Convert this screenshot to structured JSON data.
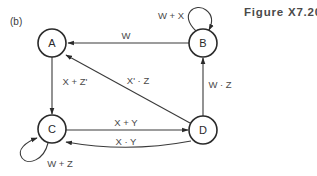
{
  "figure": {
    "title": "Figure X7.20",
    "panel_label": "(b)"
  },
  "diagram": {
    "type": "state-diagram",
    "nodes": [
      {
        "id": "A",
        "label": "A"
      },
      {
        "id": "B",
        "label": "B"
      },
      {
        "id": "C",
        "label": "C"
      },
      {
        "id": "D",
        "label": "D"
      }
    ],
    "edges": [
      {
        "from": "B",
        "to": "A",
        "label": "W"
      },
      {
        "from": "B",
        "to": "B",
        "label": "W + X"
      },
      {
        "from": "A",
        "to": "C",
        "label": "X + Z'"
      },
      {
        "from": "D",
        "to": "A",
        "label": "X' · Z"
      },
      {
        "from": "D",
        "to": "B",
        "label": "W · Z"
      },
      {
        "from": "C",
        "to": "D",
        "label": "X + Y"
      },
      {
        "from": "D",
        "to": "C",
        "label": "X · Y"
      },
      {
        "from": "C",
        "to": "C",
        "label": "W + Z"
      }
    ]
  },
  "colors": {
    "stroke": "#2a2a2a",
    "text": "#4a4a4a",
    "background": "#ffffff"
  }
}
